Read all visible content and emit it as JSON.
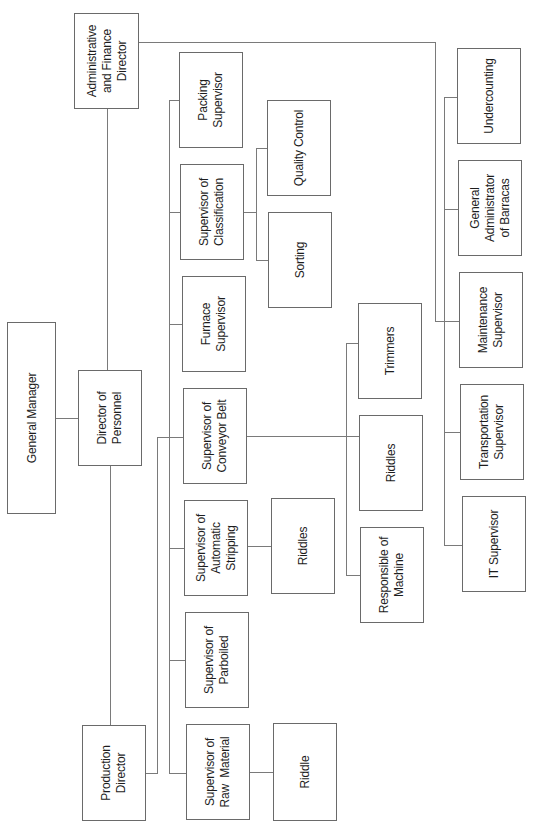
{
  "diagram": {
    "type": "org-chart",
    "orientation": "rotated-90-ccw",
    "nodes": {
      "admin_finance_director": "Administrative\nand Finance\nDirector",
      "general_manager": "General Manager",
      "director_of_personnel": "Director of\nPersonnel",
      "production_director": "Production\nDirector",
      "packing_supervisor": "Packing\nSupervisor",
      "supervisor_classification": "Supervisor of\nClassification",
      "furnace_supervisor": "Furnace\nSupervisor",
      "supervisor_conveyor_belt": "Supervisor of\nConveyor Belt",
      "supervisor_automatic_stripping": "Supervisor of\nAutomatic\nStripping",
      "supervisor_parboiled": "Supervisor of\nParboiled",
      "supervisor_raw_material": "Supervisor of\nRaw  Material",
      "quality_control": "Quality Control",
      "sorting": "Sorting",
      "riddles_stripping": "Riddles",
      "riddle_raw_material": "Riddle",
      "trimmers": "Trimmers",
      "riddles_conveyor": "Riddles",
      "responsible_of_machine": "Responsible of\nMachine",
      "undercounting": "Undercounting",
      "general_administrator_barracas": "General\nAdministrator\nof Barracas",
      "maintenance_supervisor": "Maintenance\nSupervisor",
      "transportation_supervisor": "Transportation\nSupervisor",
      "it_supervisor": "IT Supervisor"
    },
    "hierarchy": {
      "General Manager": [
        "Director of Personnel"
      ],
      "Director of Personnel": [
        "Administrative and Finance Director",
        "Production Director"
      ],
      "Production Director": [
        "Packing Supervisor",
        "Supervisor of Classification",
        "Furnace Supervisor",
        "Supervisor of Conveyor Belt",
        "Supervisor of Automatic Stripping",
        "Supervisor of Parboiled",
        "Supervisor of Raw Material"
      ],
      "Supervisor of Classification": [
        "Quality Control",
        "Sorting"
      ],
      "Supervisor of Conveyor Belt": [
        "Trimmers",
        "Riddles",
        "Responsible of Machine"
      ],
      "Supervisor of Automatic Stripping": [
        "Riddles"
      ],
      "Supervisor of Raw Material": [
        "Riddle"
      ],
      "Administrative and Finance Director": [
        "Undercounting",
        "General Administrator of Barracas",
        "Maintenance Supervisor",
        "Transportation Supervisor",
        "IT Supervisor"
      ]
    },
    "colors": {
      "line": "#7a7a7a",
      "border": "#6a6a6a",
      "text": "#1d1d1d",
      "background": "#ffffff"
    }
  }
}
